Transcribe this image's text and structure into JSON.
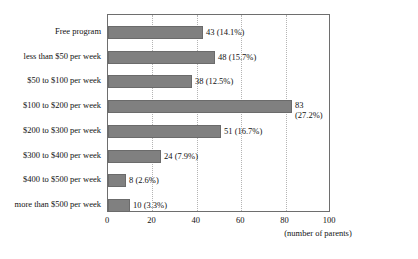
{
  "chart_data": {
    "type": "bar",
    "orientation": "horizontal",
    "title": "",
    "xlabel": "(number of parents)",
    "ylabel": "",
    "xlim": [
      0,
      100
    ],
    "xticks": [
      "0",
      "20",
      "40",
      "60",
      "80",
      "100"
    ],
    "grid": "vertical-dotted",
    "legend": "none",
    "categories": [
      "Free program",
      "less than $50 per week",
      "$50 to $100 per week",
      "$100 to $200 per week",
      "$200 to $300 per week",
      "$300 to $400 per week",
      "$400 to $500 per week",
      "more than $500 per week"
    ],
    "values": [
      43,
      48,
      38,
      83,
      51,
      24,
      8,
      10
    ],
    "percentages": [
      "14.1%",
      "15.7%",
      "12.5%",
      "27.2%",
      "16.7%",
      "7.9%",
      "2.6%",
      "3.3%"
    ],
    "data_labels": [
      "43 (14.1%)",
      "48 (15.7%)",
      "38 (12.5%)",
      "83 (27.2%)",
      "51 (16.7%)",
      "24 (7.9%)",
      "8 (2.6%)",
      "10 (3.3%)"
    ],
    "bar_color": "#808080",
    "bar_edge_color": "#6b6b6b",
    "frame_color": "#6e6e6e",
    "grid_color": "#b4b4b4",
    "background": "#ffffff"
  }
}
